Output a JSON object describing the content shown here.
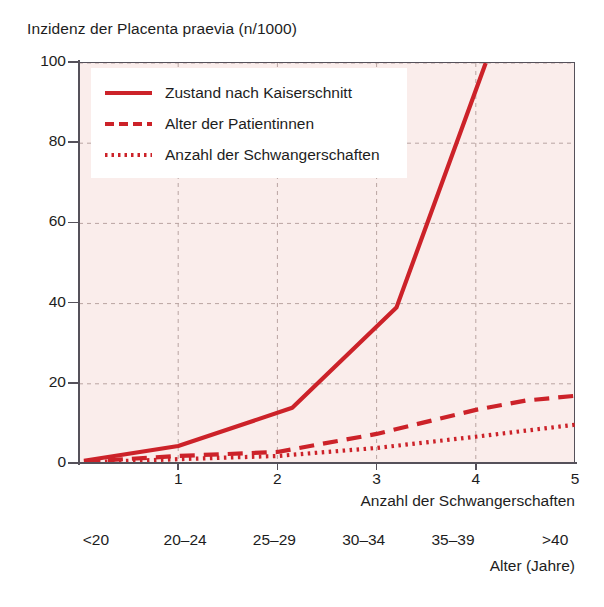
{
  "chart_data": {
    "type": "line",
    "title": "Inzidenz der Placenta praevia (n/1000)",
    "xlabel": "Anzahl der Schwangerschaften",
    "ylabel": "Inzidenz der Placenta praevia (n/1000)",
    "xlim": [
      0,
      5
    ],
    "ylim": [
      0,
      100
    ],
    "grid": true,
    "legend_position": "top-left",
    "y_ticks": [
      0,
      20,
      40,
      60,
      80,
      100
    ],
    "y_tick_labels": [
      "0",
      "20",
      "40",
      "60",
      "80",
      "100"
    ],
    "x_ticks": [
      1,
      2,
      3,
      4,
      5
    ],
    "x_tick_labels": [
      "1",
      "2",
      "3",
      "4",
      "5"
    ],
    "secondary_axis": {
      "label": "Alter (Jahre)",
      "tick_labels": [
        "<20",
        "20–24",
        "25–29",
        "30–34",
        "35–39",
        ">40"
      ],
      "tick_positions": [
        0.17,
        1.07,
        1.97,
        2.87,
        3.77,
        4.8
      ]
    },
    "series": [
      {
        "name": "Zustand nach Kaiserschnitt",
        "style": "solid",
        "color": "#cc2229",
        "x": [
          0.05,
          1.0,
          2.15,
          3.2,
          4.1
        ],
        "y": [
          0.8,
          4.5,
          14.0,
          39.0,
          100.0
        ]
      },
      {
        "name": "Alter der Patientinnen",
        "style": "dashed",
        "color": "#cc2229",
        "x": [
          0.05,
          1.0,
          2.0,
          3.0,
          4.0,
          4.5,
          5.0
        ],
        "y": [
          0.6,
          2.0,
          3.0,
          7.5,
          13.5,
          15.8,
          17.0
        ]
      },
      {
        "name": "Anzahl der Schwangerschaften",
        "style": "dotted",
        "color": "#cc2229",
        "x": [
          0.05,
          1.0,
          2.0,
          3.0,
          4.0,
          5.0
        ],
        "y": [
          0.4,
          1.2,
          2.0,
          4.0,
          6.8,
          9.8
        ]
      }
    ],
    "colors": {
      "line": "#cc2229",
      "plot_background": "#faedeb",
      "grid": "#b9a4a2",
      "axis": "#55515a",
      "text": "#1d1d1d",
      "legend_background": "#ffffff"
    }
  },
  "legend": {
    "items": [
      {
        "label": "Zustand nach Kaiserschnitt",
        "style": "solid"
      },
      {
        "label": "Alter der Patientinnen",
        "style": "dashed"
      },
      {
        "label": "Anzahl der Schwangerschaften",
        "style": "dotted"
      }
    ]
  }
}
